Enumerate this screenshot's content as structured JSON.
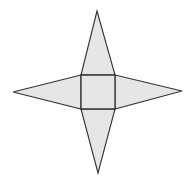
{
  "diagram": {
    "type": "square-pyramid-net",
    "fill": "#e6e6e6",
    "stroke": "#333333",
    "square": {
      "points": "81,75 115,75 115,109 81,109"
    },
    "triangles": [
      {
        "name": "top",
        "points": "81,75 97,11 115,75"
      },
      {
        "name": "right",
        "points": "115,75 182,91 115,109"
      },
      {
        "name": "bottom",
        "points": "81,109 98,173 115,109"
      },
      {
        "name": "left",
        "points": "81,75 13,92 81,109"
      }
    ]
  }
}
